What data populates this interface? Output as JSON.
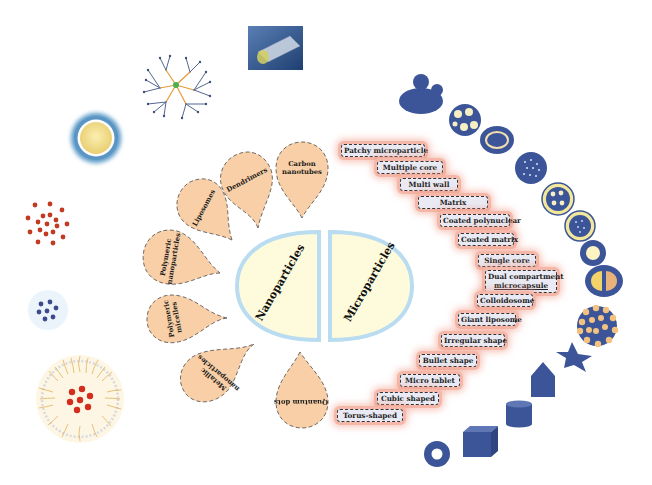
{
  "center": {
    "left_label": "Nanoparticles",
    "right_label": "Microparticles"
  },
  "nanoparticles": [
    {
      "label": "Carbon nanotubes",
      "line1": "Carbon",
      "line2": "nanotubes"
    },
    {
      "label": "Dendrimers"
    },
    {
      "label": "Liposomes"
    },
    {
      "label": "Polymeric nanoparticles",
      "line1": "Polymeric",
      "line2": "nanoparticles"
    },
    {
      "label": "Polymeric micelles",
      "line1": "Polymeric",
      "line2": "micelles"
    },
    {
      "label": "Metallic nanoparticles",
      "line1": "Metallic",
      "line2": "nanoparticles"
    },
    {
      "label": "Quantum dots"
    }
  ],
  "microparticles": [
    {
      "label": "Patchy microparticle"
    },
    {
      "label": "Multiple core"
    },
    {
      "label": "Multi wall"
    },
    {
      "label": "Matrix"
    },
    {
      "label": "Coated polynuclear"
    },
    {
      "label": "Coated matrix"
    },
    {
      "label": "Single core"
    },
    {
      "label": "Dual compartment microcapsule",
      "line1": "Dual compartment",
      "line2": "microcapsule"
    },
    {
      "label": "Colloidosome"
    },
    {
      "label": "Giant liposome"
    },
    {
      "label": "Irregular shape"
    },
    {
      "label": "Bullet shape"
    },
    {
      "label": "Micro tablet"
    },
    {
      "label": "Cubic shaped"
    },
    {
      "label": "Torus-shaped"
    }
  ],
  "icons": {
    "nano": [
      "carbon-nanotube-image",
      "dendrimer-icon",
      "liposome-icon",
      "polymeric-nanoparticle-icon",
      "quantum-dot-cluster-icon",
      "polymeric-micelle-icon"
    ],
    "micro": [
      "patchy-particle-icon",
      "multiple-core-icon",
      "multi-wall-icon",
      "matrix-icon",
      "coated-polynuclear-icon",
      "coated-matrix-icon",
      "single-core-icon",
      "dual-compartment-icon",
      "colloidosome-icon",
      "irregular-star-icon",
      "bullet-shape-icon",
      "micro-tablet-cylinder-icon",
      "cube-icon",
      "torus-icon"
    ]
  },
  "colors": {
    "drop_fill": "#f8cfa6",
    "center_fill": "#fefbdc",
    "center_glow": "#b9dcf0",
    "label_fill": "#e9eaf3",
    "label_glow": "#f4b7a8",
    "particle_blue": "#3c5598",
    "particle_yellow": "#f3e79a"
  }
}
